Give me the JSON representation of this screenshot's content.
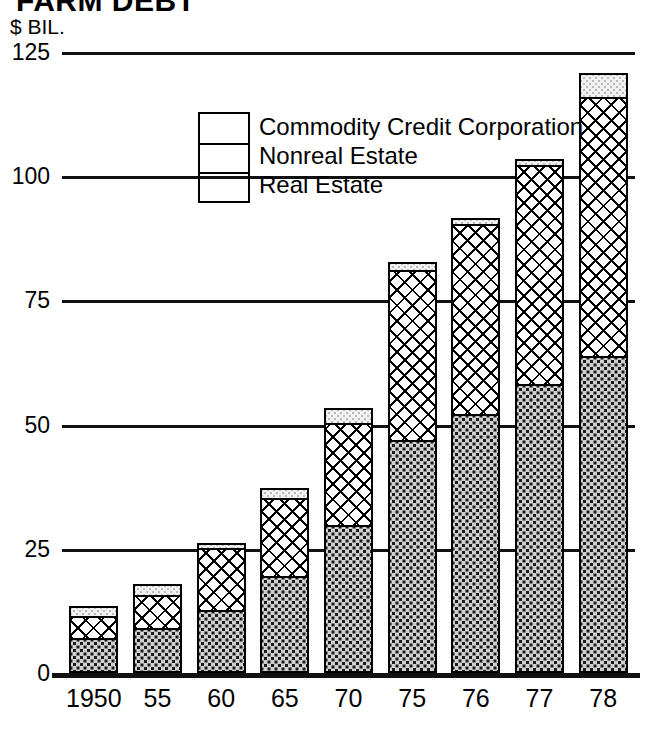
{
  "chart_data": {
    "type": "bar",
    "title": "FARM DEBT",
    "subtitle": "",
    "xlabel": "",
    "ylabel": "$ BIL.",
    "ylim": [
      0,
      125
    ],
    "yticks": [
      0,
      25,
      50,
      75,
      100,
      125
    ],
    "grid": true,
    "stacked": true,
    "legend_position": "inside-top-left",
    "categories": [
      "1950",
      "55",
      "60",
      "65",
      "70",
      "75",
      "76",
      "77",
      "78"
    ],
    "series": [
      {
        "name": "Real Estate",
        "values": [
          6.6,
          8.7,
          12.3,
          19.1,
          29.4,
          46.5,
          51.7,
          57.7,
          63.5
        ]
      },
      {
        "name": "Nonreal Estate",
        "values": [
          4.4,
          6.6,
          12.5,
          15.7,
          20.5,
          34.2,
          38.2,
          44.1,
          52.0
        ]
      },
      {
        "name": "Commodity Credit Corporation",
        "values": [
          1.6,
          1.8,
          0.5,
          1.6,
          2.6,
          1.2,
          0.8,
          0.8,
          4.5
        ]
      }
    ],
    "totals": [
      12.6,
      17.1,
      25.3,
      36.4,
      52.5,
      81.9,
      90.7,
      102.6,
      120.0
    ]
  },
  "axis": {
    "y_unit_label": "$ BIL.",
    "y_tick_labels": [
      "125",
      "100",
      "75",
      "50",
      "25",
      "0"
    ],
    "x_tick_labels": [
      "1950",
      "55",
      "60",
      "65",
      "70",
      "75",
      "76",
      "77",
      "78"
    ]
  },
  "legend": {
    "entries": [
      {
        "label": "Commodity Credit Corporation",
        "pattern": "light-stipple"
      },
      {
        "label": "Nonreal Estate",
        "pattern": "cross-hatch"
      },
      {
        "label": "Real Estate",
        "pattern": "dark-stipple"
      }
    ]
  },
  "colors": {
    "ink": "#000000",
    "background": "#ffffff",
    "ccc_fill": "#f2f2f2",
    "nonreal_fill": "#ffffff",
    "real_fill": "#cfcfcf"
  }
}
